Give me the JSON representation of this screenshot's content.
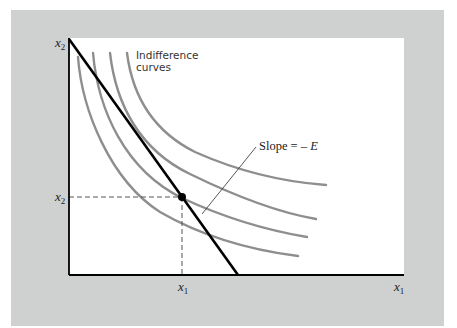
{
  "figure": {
    "y_axis_label": {
      "var": "x",
      "sub": "2"
    },
    "x_axis_label": {
      "var": "x",
      "sub": "1"
    },
    "y_tick_label": {
      "var": "x",
      "sub": "2"
    },
    "x_tick_label": {
      "var": "x",
      "sub": "1"
    },
    "annotations": {
      "indifference_line1": "Indifference",
      "indifference_line2": "curves",
      "slope_prefix": "Slope = – ",
      "slope_var": "E"
    },
    "colors": {
      "panel_background": "#cfd0d0",
      "plot_background": "#ffffff",
      "indifference_curve": "#8e8e8e",
      "budget_line": "#000000",
      "axes": "#000000"
    },
    "elements": {
      "indifference_curve_count": 4,
      "budget_line": "straight line from top of vertical axis to horizontal axis",
      "tangency_point": "filled black dot where budget line touches second curve",
      "guides": "dashed lines from tangency point to both axes"
    }
  }
}
